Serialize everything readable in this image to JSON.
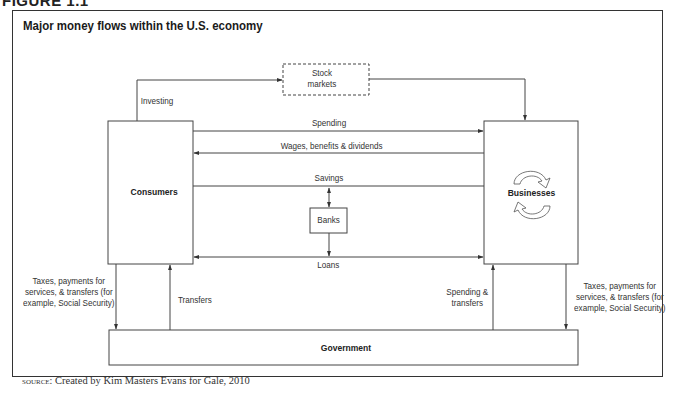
{
  "figure": {
    "label": "FIGURE 1.1",
    "title": "Major money flows within the U.S. economy"
  },
  "nodes": {
    "consumers": "Consumers",
    "businesses": "Businesses",
    "government": "Government",
    "banks": "Banks",
    "stock_markets": "Stock\nmarkets",
    "stock_markets_line1": "Stock",
    "stock_markets_line2": "markets"
  },
  "flows": {
    "investing": "Investing",
    "spending": "Spending",
    "wages": "Wages, benefits & dividends",
    "savings": "Savings",
    "loans": "Loans",
    "consumer_taxes_line1": "Taxes, payments for",
    "consumer_taxes_line2": "services, & transfers (for",
    "consumer_taxes_line3": "example, Social Security)",
    "transfers": "Transfers",
    "spending_transfers_line1": "Spending &",
    "spending_transfers_line2": "transfers",
    "business_taxes_line1": "Taxes, payments for",
    "business_taxes_line2": "services, & transfers (for",
    "business_taxes_line3": "example, Social Security)"
  },
  "edges": [
    {
      "from": "Consumers",
      "to": "Stock markets",
      "label": "Investing"
    },
    {
      "from": "Stock markets",
      "to": "Businesses",
      "label": ""
    },
    {
      "from": "Consumers",
      "to": "Businesses",
      "label": "Spending"
    },
    {
      "from": "Businesses",
      "to": "Consumers",
      "label": "Wages, benefits & dividends"
    },
    {
      "from": "Consumers",
      "to": "Banks",
      "label": "Savings",
      "bidirectional": true
    },
    {
      "from": "Businesses",
      "to": "Banks",
      "label": "Savings",
      "bidirectional": true
    },
    {
      "from": "Banks",
      "to": "Consumers",
      "label": "Loans"
    },
    {
      "from": "Banks",
      "to": "Businesses",
      "label": "Loans"
    },
    {
      "from": "Consumers",
      "to": "Government",
      "label": "Taxes, payments for services, & transfers (for example, Social Security)"
    },
    {
      "from": "Government",
      "to": "Consumers",
      "label": "Transfers"
    },
    {
      "from": "Government",
      "to": "Businesses",
      "label": "Spending & transfers"
    },
    {
      "from": "Businesses",
      "to": "Government",
      "label": "Taxes, payments for services, & transfers (for example, Social Security)"
    }
  ],
  "source": {
    "prefix": "source:",
    "text": "Created by Kim Masters Evans for Gale, 2010"
  },
  "colors": {
    "line": "#333333",
    "background": "#ffffff"
  }
}
